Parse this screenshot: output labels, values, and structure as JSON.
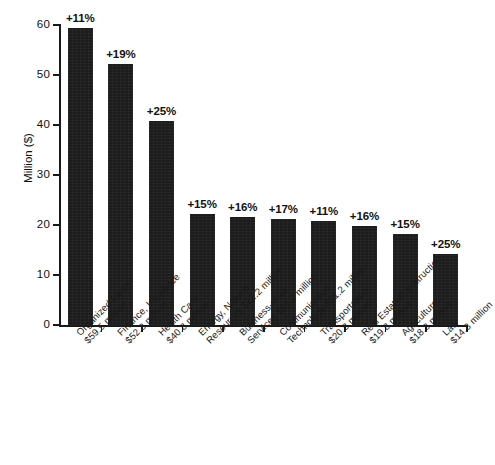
{
  "chart_data": {
    "type": "bar",
    "title": "",
    "subtitle": "",
    "xlabel": "",
    "ylabel": "Million ($)",
    "ylim": [
      0,
      60
    ],
    "ytick_values": [
      0,
      10,
      20,
      30,
      40,
      50,
      60
    ],
    "ytick_labels": [
      "0",
      "10",
      "20",
      "30",
      "40",
      "50",
      "60"
    ],
    "grid": false,
    "legend": "none",
    "bar_color": "#1c1c1c",
    "background_color": "#ffffff",
    "categories": [
      "Organized Labor",
      "Finance, Insurance",
      "Health Care",
      "Energy, Natural Resources",
      "Business-retail Services",
      "Communication, Technology",
      "Transportation",
      "Real Estate/Construction",
      "Agriculture",
      "Law"
    ],
    "values": [
      59.5,
      52.3,
      40.8,
      22.2,
      21.7,
      21.2,
      20.8,
      19.8,
      18.3,
      14.3
    ],
    "data_labels": [
      "+11%",
      "+19%",
      "+25%",
      "+15%",
      "+16%",
      "+17%",
      "+11%",
      "+16%",
      "+15%",
      "+25%"
    ],
    "tick_labels": [
      [
        "Organized Labor",
        "$59.5 million"
      ],
      [
        "Finance, Insurance",
        "$52.3 million"
      ],
      [
        "Health Care",
        "$40.8 million"
      ],
      [
        "Energy, Natural",
        "Resources $22.2 million"
      ],
      [
        "Business-retail",
        "Services $21.7 million"
      ],
      [
        "Communication,",
        "Technology $21.2 million"
      ],
      [
        "Transportation",
        "$20.8 million"
      ],
      [
        "Real Estate/Construction",
        "$19.8 million"
      ],
      [
        "Agriculture",
        "$18.3 million"
      ],
      [
        "Law",
        "$14.3 million"
      ]
    ],
    "value_labels": [
      "$59.5 million",
      "$52.3 million",
      "$40.8 million",
      "$22.2 million",
      "$21.7 million",
      "$21.2 million",
      "$20.8 million",
      "$19.8 million",
      "$18.3 million",
      "$14.3 million"
    ]
  }
}
